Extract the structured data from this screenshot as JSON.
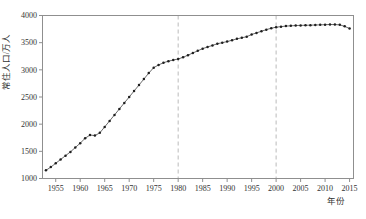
{
  "figure": {
    "ylabel": "常住人口/万人",
    "xlabel": "年份"
  },
  "chart_data": {
    "type": "line",
    "title": "",
    "xlabel": "年份",
    "ylabel": "常住人口/万人",
    "xlim": [
      1952.3,
      2015.8
    ],
    "ylim": [
      1000,
      4000
    ],
    "xticks": [
      1955,
      1960,
      1965,
      1970,
      1975,
      1980,
      1985,
      1990,
      1995,
      2000,
      2005,
      2010,
      2015
    ],
    "yticks": [
      1000,
      1500,
      2000,
      2500,
      3000,
      3500,
      4000
    ],
    "grid": false,
    "legend_position": "none",
    "dashed_vlines_x": [
      1980,
      2000
    ],
    "years": [
      1953,
      1954,
      1955,
      1956,
      1957,
      1958,
      1959,
      1960,
      1961,
      1962,
      1963,
      1964,
      1965,
      1966,
      1967,
      1968,
      1969,
      1970,
      1971,
      1972,
      1973,
      1974,
      1975,
      1976,
      1977,
      1978,
      1979,
      1980,
      1981,
      1982,
      1983,
      1984,
      1985,
      1986,
      1987,
      1988,
      1989,
      1990,
      1991,
      1992,
      1993,
      1994,
      1995,
      1996,
      1997,
      1998,
      1999,
      2000,
      2001,
      2002,
      2003,
      2004,
      2005,
      2006,
      2007,
      2008,
      2009,
      2010,
      2011,
      2012,
      2013,
      2014,
      2015
    ],
    "series": [
      {
        "name": "常住人口",
        "values": [
          1150,
          1210,
          1280,
          1350,
          1420,
          1490,
          1570,
          1650,
          1740,
          1800,
          1790,
          1840,
          1950,
          2060,
          2170,
          2280,
          2390,
          2500,
          2610,
          2720,
          2830,
          2940,
          3040,
          3090,
          3130,
          3160,
          3180,
          3200,
          3230,
          3270,
          3310,
          3350,
          3390,
          3420,
          3450,
          3480,
          3500,
          3520,
          3545,
          3570,
          3590,
          3610,
          3650,
          3680,
          3710,
          3740,
          3765,
          3785,
          3795,
          3805,
          3810,
          3815,
          3818,
          3820,
          3822,
          3825,
          3828,
          3831,
          3834,
          3833,
          3828,
          3800,
          3760
        ]
      }
    ],
    "colors": {
      "line": "#5a5a5a",
      "marker": "#1f1f1f",
      "frame": "#8f8f8f",
      "dashed_line": "#b3b3b3",
      "tick_text": "#333333",
      "background": "#ffffff"
    },
    "layout": {
      "width": 366,
      "height": 219,
      "plot_left": 42.5,
      "plot_top": 15.5,
      "plot_right": 353.5,
      "plot_bottom": 178.5
    }
  }
}
